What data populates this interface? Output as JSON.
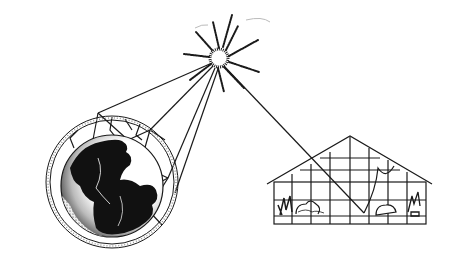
{
  "diagram": {
    "title": "Greenhouse effect: sunlight reaching Earth's atmosphere and a greenhouse",
    "elements": {
      "sun": {
        "label": "Sun",
        "cx": 219,
        "cy": 58
      },
      "earth": {
        "label": "Earth",
        "cx": 112,
        "cy": 182
      },
      "atmosphere": {
        "label": "Atmosphere"
      },
      "greenhouse": {
        "label": "Greenhouse"
      }
    },
    "colors": {
      "ink": "#1a1a1a",
      "background": "#ffffff"
    }
  }
}
